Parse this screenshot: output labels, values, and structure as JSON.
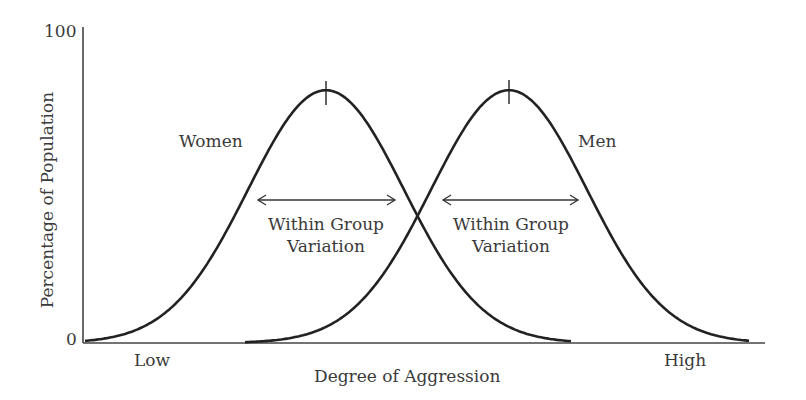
{
  "chart_data": {
    "type": "line",
    "title": "",
    "xlabel": "Degree of Aggression",
    "ylabel": "Percentage of Population",
    "y_ticks": [
      "0",
      "100"
    ],
    "x_ticks": [
      "Low",
      "High"
    ],
    "ylim": [
      0,
      100
    ],
    "grid": false,
    "series": [
      {
        "name": "Women",
        "distribution": "normal",
        "center_px": 326,
        "sigma_px": 78,
        "peak_pct": 80,
        "start_px": 85,
        "end_px": 572
      },
      {
        "name": "Men",
        "distribution": "normal",
        "center_px": 509,
        "sigma_px": 78,
        "peak_pct": 80,
        "start_px": 245,
        "end_px": 750
      }
    ],
    "annotations": [
      {
        "text": "Within Group Variation",
        "arrow_from_px": 258,
        "arrow_to_px": 395,
        "group": "Women"
      },
      {
        "text": "Within Group Variation",
        "arrow_from_px": 443,
        "arrow_to_px": 578,
        "group": "Men"
      }
    ]
  },
  "labels": {
    "y_max": "100",
    "y_min": "0",
    "x_low": "Low",
    "x_high": "High",
    "x_axis": "Degree of Aggression",
    "y_axis": "Percentage of Population",
    "women": "Women",
    "men": "Men",
    "variation_line1": "Within Group",
    "variation_line2": "Variation"
  },
  "colors": {
    "curve": "#222222",
    "axis": "#444444",
    "text": "#3a3a3a"
  }
}
